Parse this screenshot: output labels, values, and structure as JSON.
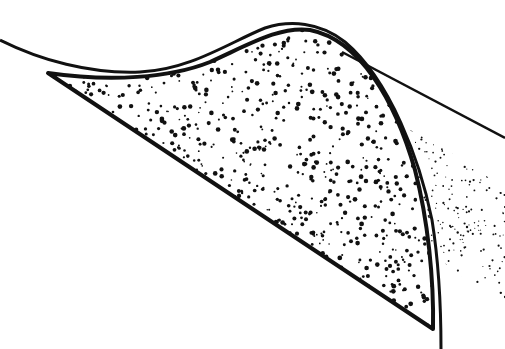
{
  "diagram": {
    "background": "#ffffff",
    "ink": "#111111",
    "stipple_seed": 7,
    "stipple_density_main": 1400,
    "stipple_density_fan": 260
  }
}
